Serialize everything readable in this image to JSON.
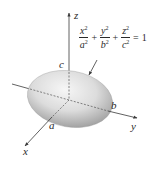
{
  "figure": {
    "type": "ellipsoid-diagram",
    "equation": {
      "terms": [
        {
          "num_var": "x",
          "num_exp": "2",
          "den_var": "a",
          "den_exp": "2"
        },
        {
          "num_var": "y",
          "num_exp": "2",
          "den_var": "b",
          "den_exp": "2"
        },
        {
          "num_var": "z",
          "num_exp": "2",
          "den_var": "c",
          "den_exp": "2"
        }
      ],
      "plus": "+",
      "equals": "=",
      "rhs": "1"
    },
    "axes": {
      "x": {
        "label": "x"
      },
      "y": {
        "label": "y"
      },
      "z": {
        "label": "z"
      }
    },
    "intercepts": {
      "a": "a",
      "b": "b",
      "c": "c"
    },
    "colors": {
      "surface_light": "#f4f4f4",
      "surface_dark": "#8a8a8a",
      "axis": "#3a3a3a",
      "text": "#2a2a2a"
    }
  }
}
